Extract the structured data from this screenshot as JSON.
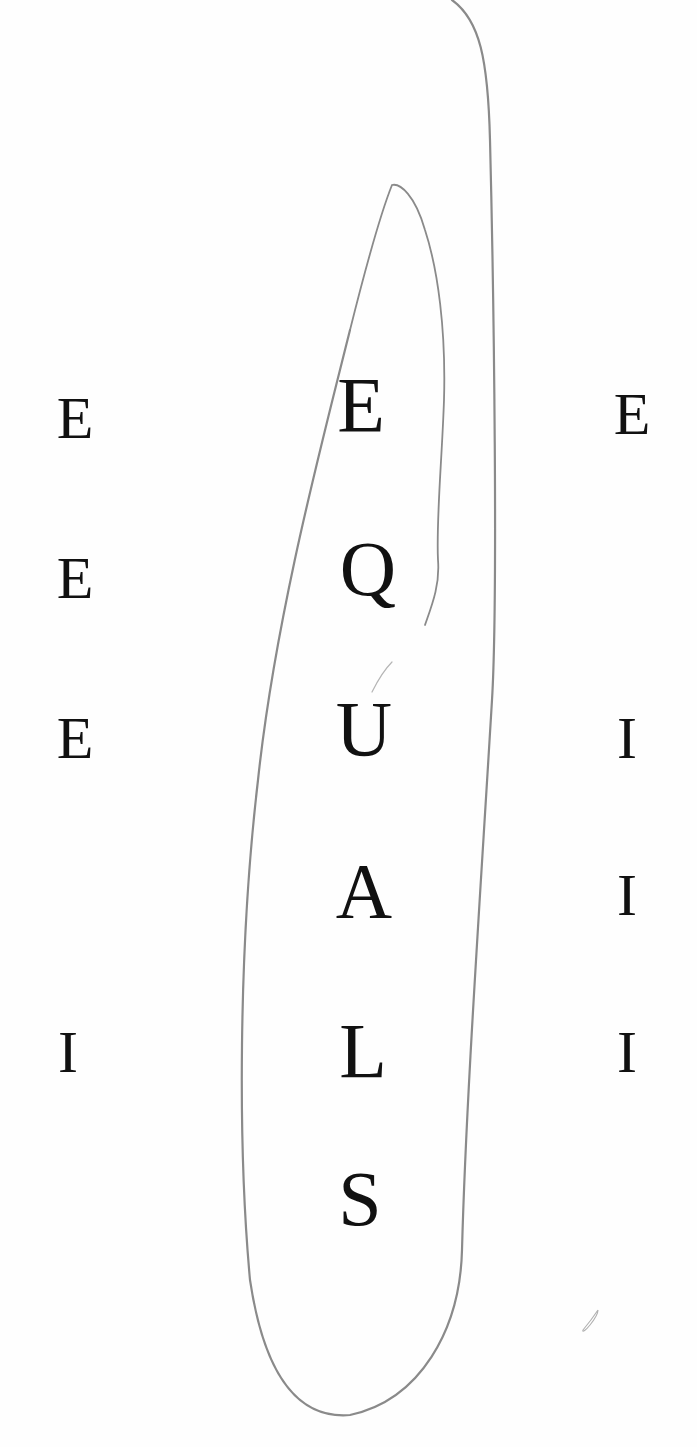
{
  "artwork": {
    "center_word": [
      "E",
      "Q",
      "U",
      "A",
      "L",
      "S"
    ],
    "left_column": [
      "E",
      "E",
      "E",
      "I"
    ],
    "right_column": [
      "E",
      "I",
      "I",
      "I"
    ],
    "ink_color": "#111111",
    "line_color": "#8a8a8a",
    "paper_color": "#fefefe"
  }
}
